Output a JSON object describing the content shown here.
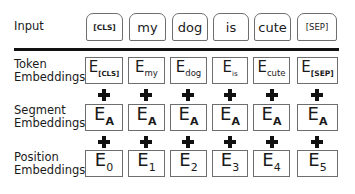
{
  "rows": {
    "input": {
      "label": "Input"
    },
    "token": {
      "label_line1": "Token",
      "label_line2": "Embeddings"
    },
    "segment": {
      "label_line1": "Segment",
      "label_line2": "Embeddings"
    },
    "position": {
      "label_line1": "Position",
      "label_line2": "Embeddings"
    }
  },
  "tokens": [
    "[CLS]",
    "my",
    "dog",
    "is",
    "cute",
    "[SEP]"
  ],
  "token_embeddings": [
    {
      "base": "E",
      "sub": "[CLS]"
    },
    {
      "base": "E",
      "sub": "my"
    },
    {
      "base": "E",
      "sub": "dog"
    },
    {
      "base": "E",
      "sub": "is"
    },
    {
      "base": "E",
      "sub": "cute"
    },
    {
      "base": "E",
      "sub": "[SEP]"
    }
  ],
  "segment_embeddings": [
    {
      "base": "E",
      "sub": "A"
    },
    {
      "base": "E",
      "sub": "A"
    },
    {
      "base": "E",
      "sub": "A"
    },
    {
      "base": "E",
      "sub": "A"
    },
    {
      "base": "E",
      "sub": "A"
    },
    {
      "base": "E",
      "sub": "A"
    }
  ],
  "position_embeddings": [
    {
      "base": "E",
      "sub": "0"
    },
    {
      "base": "E",
      "sub": "1"
    },
    {
      "base": "E",
      "sub": "2"
    },
    {
      "base": "E",
      "sub": "3"
    },
    {
      "base": "E",
      "sub": "4"
    },
    {
      "base": "E",
      "sub": "5"
    }
  ],
  "operator_symbol": "plus-icon"
}
